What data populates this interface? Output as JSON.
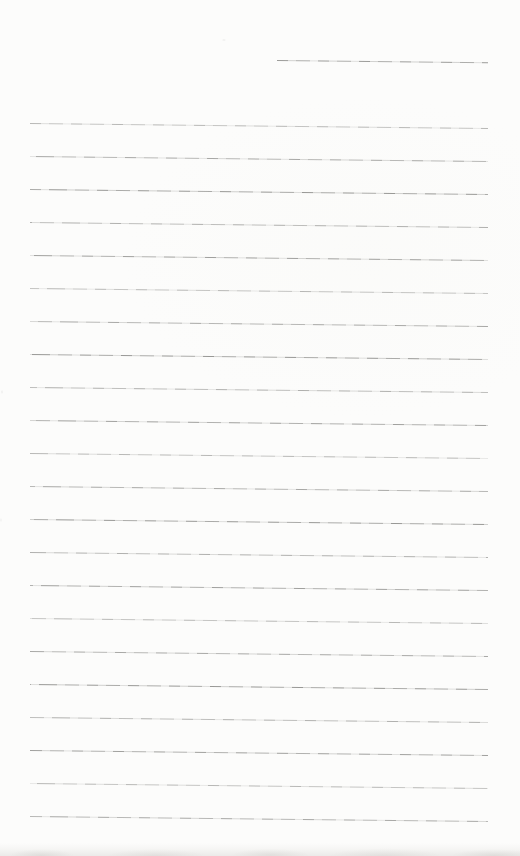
{
  "document": {
    "kind": "blank ruled notebook page (scanned, no text)",
    "text_content": "",
    "colors": {
      "paper": "#fcfcfb",
      "rule": "#9a9a97",
      "bottom_edge": "#edebe8"
    },
    "tilt_deg": 0.62,
    "header_line": {
      "left": 277,
      "top": 60,
      "width": 211
    },
    "ruled_lines": {
      "count": 22,
      "left": 30,
      "top_first": 123,
      "spacing": 33,
      "width": 458
    },
    "bottom_edge_strip": {
      "top": 843,
      "height": 13
    }
  }
}
